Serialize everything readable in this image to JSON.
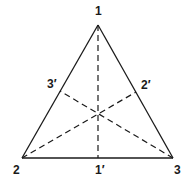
{
  "diagram": {
    "type": "triangle-medians",
    "vertices": [
      {
        "id": "1",
        "label": "1",
        "x": 98,
        "y": 25,
        "label_x": 95,
        "label_y": 15
      },
      {
        "id": "2",
        "label": "2",
        "x": 22,
        "y": 158,
        "label_x": 13,
        "label_y": 174
      },
      {
        "id": "3",
        "label": "3",
        "x": 173,
        "y": 158,
        "label_x": 174,
        "label_y": 174
      }
    ],
    "midpoints": [
      {
        "id": "1p",
        "label": "1′",
        "x": 98,
        "y": 158,
        "label_x": 95,
        "label_y": 174
      },
      {
        "id": "2p",
        "label": "2′",
        "x": 136,
        "y": 92,
        "label_x": 141,
        "label_y": 89
      },
      {
        "id": "3p",
        "label": "3′",
        "x": 60,
        "y": 91,
        "label_x": 47,
        "label_y": 88
      }
    ],
    "centroid": {
      "x": 98,
      "y": 114
    },
    "sides": [
      {
        "from": "1",
        "to": "2",
        "style": "solid"
      },
      {
        "from": "2",
        "to": "3",
        "style": "solid"
      },
      {
        "from": "3",
        "to": "1",
        "style": "solid"
      }
    ],
    "medians": [
      {
        "from": "1",
        "to": "1p",
        "style": "dashed"
      },
      {
        "from": "2",
        "to": "2p",
        "style": "dashed"
      },
      {
        "from": "3",
        "to": "3p",
        "style": "dashed"
      }
    ],
    "colors": {
      "stroke": "#1a1a1a",
      "background": "#ffffff"
    }
  }
}
